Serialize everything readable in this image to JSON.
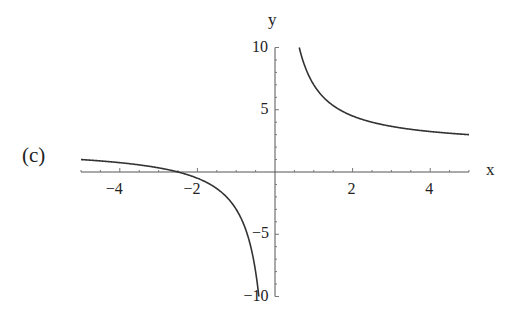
{
  "panel_label": "(c)",
  "chart_data": {
    "type": "line",
    "title": "",
    "function": "y = 2 + 5/x",
    "xlabel": "x",
    "ylabel": "y",
    "xlim": [
      -5,
      5
    ],
    "ylim": [
      -10,
      10
    ],
    "x_ticks": [
      -4,
      -2,
      2,
      4
    ],
    "x_tick_labels": [
      "−4",
      "−2",
      "2",
      "4"
    ],
    "y_ticks": [
      -10,
      -5,
      5,
      10
    ],
    "y_tick_labels": [
      "−10",
      "−5",
      "5",
      "10"
    ],
    "grid": false,
    "legend": null,
    "series": [
      {
        "name": "branch-left",
        "x": [
          -5,
          -4,
          -3,
          -2.5,
          -2,
          -1.5,
          -1,
          -0.75,
          -0.5,
          -0.4167
        ],
        "y": [
          1,
          0.75,
          0.33,
          0,
          -0.5,
          -1.33,
          -3,
          -4.67,
          -8,
          -10
        ]
      },
      {
        "name": "branch-right",
        "x": [
          0.625,
          0.75,
          1,
          1.5,
          2,
          3,
          4,
          5
        ],
        "y": [
          10,
          8.67,
          7,
          5.33,
          4.5,
          3.67,
          3.25,
          3
        ]
      }
    ],
    "colors": {
      "curve": "#333333",
      "axes": "#555555"
    }
  }
}
